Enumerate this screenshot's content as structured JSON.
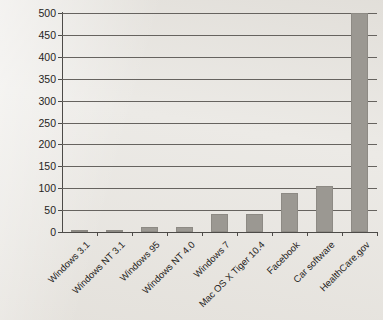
{
  "chart_data": {
    "type": "bar",
    "title": "",
    "xlabel": "",
    "ylabel": "SLOC in Millions",
    "ylim": [
      0,
      500
    ],
    "ytick_step": 50,
    "yticks": [
      0,
      50,
      100,
      150,
      200,
      250,
      300,
      350,
      400,
      450,
      500
    ],
    "ytick_labels": [
      "0",
      "50",
      "100",
      "150",
      "200",
      "250",
      "300",
      "350",
      "400",
      "450",
      "500"
    ],
    "grid": "horizontal",
    "legend": "none",
    "bar_color": "#9b9892",
    "axis_color": "#4d4b48",
    "background_color": "#ebe9e5",
    "categories": [
      "Windows 3.1",
      "Windows NT 3.1",
      "Windows 95",
      "Windows NT 4.0",
      "Windows 7",
      "Mac OS X Tiger 10.4",
      "Facebook",
      "Car software",
      "HealthCare.gov"
    ],
    "values": [
      3,
      5,
      11,
      12,
      40,
      40,
      90,
      105,
      500
    ],
    "series": [
      {
        "name": "SLOC in Millions",
        "values": [
          3,
          5,
          11,
          12,
          40,
          40,
          90,
          105,
          500
        ]
      }
    ]
  }
}
